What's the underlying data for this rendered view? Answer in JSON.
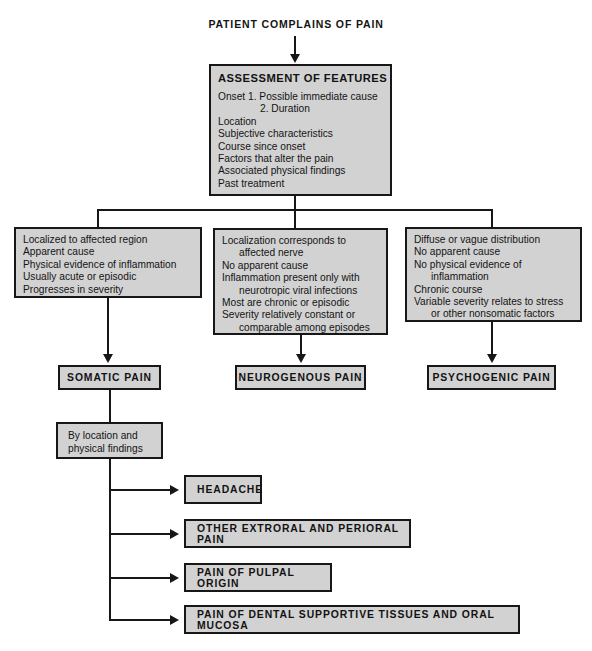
{
  "diagram": {
    "title": "PATIENT COMPLAINS OF PAIN",
    "assessment": {
      "heading": "ASSESSMENT OF FEATURES",
      "lines": [
        "Onset 1. Possible immediate cause",
        "2. Duration",
        "Location",
        "Subjective characteristics",
        "Course since onset",
        "Factors that alter the pain",
        "Associated physical findings",
        "Past treatment"
      ]
    },
    "branches": [
      {
        "id": "somatic",
        "criteria": [
          "Localized to affected region",
          "Apparent cause",
          "Physical evidence of inflammation",
          "Usually acute or episodic",
          "Progresses in severity"
        ],
        "result": "SOMATIC PAIN"
      },
      {
        "id": "neurogenous",
        "criteria": [
          "Localization corresponds to",
          "affected nerve",
          "No apparent cause",
          "Inflammation present only with",
          "neurotropic viral infections",
          "Most are chronic or episodic",
          "Severity relatively constant or",
          "comparable among episodes"
        ],
        "result": "NEUROGENOUS PAIN"
      },
      {
        "id": "psychogenic",
        "criteria": [
          "Diffuse or vague distribution",
          "No apparent cause",
          "No physical evidence of",
          "inflammation",
          "Chronic course",
          "Variable severity relates to stress",
          "or other nonsomatic factors"
        ],
        "result": "PSYCHOGENIC PAIN"
      }
    ],
    "subdivision": {
      "label_line1": "By location and",
      "label_line2": "physical findings",
      "outcomes": [
        "HEADACHE",
        "OTHER EXTRORAL AND PERIORAL PAIN",
        "PAIN OF PULPAL ORIGIN",
        "PAIN OF DENTAL SUPPORTIVE TISSUES AND ORAL MUCOSA"
      ]
    },
    "colors": {
      "box_fill": "#d2d2d2",
      "border": "#171717",
      "background": "#ffffff"
    }
  }
}
